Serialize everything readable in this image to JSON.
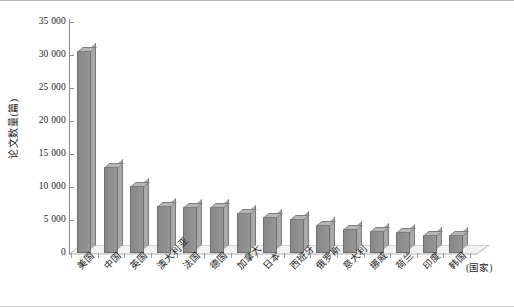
{
  "chart_data": {
    "type": "bar",
    "title": "",
    "xlabel": "(国家)",
    "ylabel": "论文数量(篇)",
    "ylim": [
      0,
      35000
    ],
    "ytick_step": 5000,
    "grid": false,
    "legend": "none",
    "style": "3d-column",
    "bar_color": "#8e8e8e",
    "yticks": [
      "0",
      "5 000",
      "10 000",
      "15 000",
      "20 000",
      "25 000",
      "30 000",
      "35 000"
    ],
    "categories": [
      "美国",
      "中国",
      "英国",
      "澳大利亚",
      "法国",
      "德国",
      "加拿大",
      "日本",
      "西班牙",
      "俄罗斯",
      "意大利",
      "挪威",
      "荷兰",
      "印度",
      "韩国"
    ],
    "values": [
      30600,
      13000,
      10100,
      7100,
      7000,
      7000,
      6000,
      5500,
      5100,
      4200,
      3700,
      3300,
      3200,
      2800,
      2700
    ]
  },
  "axis": {
    "y_title": "论文数量(篇)",
    "x_title": "(国家)"
  }
}
